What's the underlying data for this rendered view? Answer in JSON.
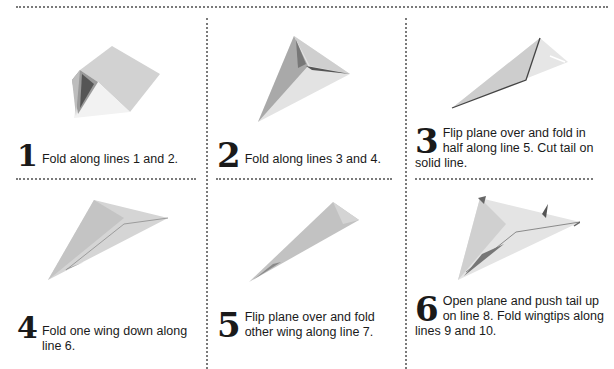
{
  "steps": [
    {
      "number": "1",
      "text": "Fold along lines 1 and 2.",
      "illustration": "paper-fold-step-1-icon"
    },
    {
      "number": "2",
      "text": "Fold along lines 3 and 4.",
      "illustration": "paper-fold-step-2-icon"
    },
    {
      "number": "3",
      "text": "Flip plane over and fold in half along line 5. Cut tail on solid line.",
      "illustration": "paper-fold-step-3-icon"
    },
    {
      "number": "4",
      "text": "Fold one wing down along line 6.",
      "illustration": "paper-fold-step-4-icon"
    },
    {
      "number": "5",
      "text": "Flip plane over and fold other wing along line 7.",
      "illustration": "paper-fold-step-5-icon"
    },
    {
      "number": "6",
      "text": "Open plane and push tail up on line 8. Fold wingtips along lines 9 and 10.",
      "illustration": "paper-airplane-final-icon"
    }
  ],
  "colors": {
    "divider": "#7a7a7a",
    "paper_light": "#e8e8e8",
    "paper_mid": "#c9c9c9",
    "paper_dark": "#8a8a8a",
    "text": "#1a1a1a"
  }
}
